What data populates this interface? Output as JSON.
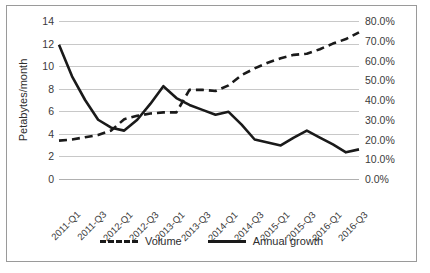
{
  "chart_data": {
    "type": "line",
    "title": "",
    "xlabel": "",
    "ylabel": "Petabytes/month",
    "y2label": "",
    "grid": true,
    "legend_position": "bottom",
    "x": [
      "2011-Q1",
      "2011-Q2",
      "2011-Q3",
      "2011-Q4",
      "2012-Q1",
      "2012-Q2",
      "2012-Q3",
      "2012-Q4",
      "2013-Q1",
      "2013-Q2",
      "2013-Q3",
      "2013-Q4",
      "2014-Q1",
      "2014-Q2",
      "2014-Q3",
      "2014-Q4",
      "2015-Q1",
      "2015-Q2",
      "2015-Q3",
      "2015-Q4",
      "2016-Q1",
      "2016-Q2",
      "2016-Q3",
      "2016-Q4"
    ],
    "xtick_labels": [
      "2011-Q1",
      "2011-Q3",
      "2012-Q1",
      "2012-Q3",
      "2013-Q1",
      "2013-Q3",
      "2014-Q1",
      "2014-Q3",
      "2015-Q1",
      "2015-Q3",
      "2016-Q1",
      "2016-Q3"
    ],
    "ylim": [
      0,
      14
    ],
    "yticks": [
      0,
      2,
      4,
      6,
      8,
      10,
      12,
      14
    ],
    "ytick_labels": [
      "0",
      "2",
      "4",
      "6",
      "8",
      "10",
      "12",
      "14"
    ],
    "y2lim": [
      0,
      80
    ],
    "y2ticks": [
      0,
      10,
      20,
      30,
      40,
      50,
      60,
      70,
      80
    ],
    "y2tick_labels": [
      "0.0%",
      "10.0%",
      "20.0%",
      "30.0%",
      "40.0%",
      "50.0%",
      "60.0%",
      "70.0%",
      "80.0%"
    ],
    "series": [
      {
        "name": "Volume",
        "axis": "left",
        "style": "dashed",
        "color": "#1a1a1a",
        "values": [
          3.4,
          3.5,
          3.7,
          3.9,
          4.3,
          5.3,
          5.6,
          5.8,
          5.9,
          5.9,
          7.9,
          7.9,
          7.8,
          8.3,
          9.2,
          9.8,
          10.3,
          10.7,
          11.0,
          11.1,
          11.5,
          12.0,
          12.4,
          13.0
        ]
      },
      {
        "name": "Annual growth",
        "axis": "right",
        "style": "solid",
        "color": "#1a1a1a",
        "values": [
          68.0,
          52.0,
          40.0,
          30.0,
          26.0,
          24.5,
          30.0,
          38.0,
          47.0,
          41.0,
          37.5,
          35.0,
          32.5,
          34.0,
          27.5,
          20.0,
          18.5,
          17.0,
          21.0,
          24.5,
          21.0,
          17.5,
          13.5,
          15.0
        ]
      }
    ],
    "legend": [
      {
        "label": "Volume",
        "style": "dashed"
      },
      {
        "label": "Annual growth",
        "style": "solid"
      }
    ]
  },
  "colors": {
    "line": "#1a1a1a",
    "grid": "#c8c8c8",
    "border": "#9a9a9a",
    "text": "#2e2e2e",
    "background": "#ffffff"
  }
}
